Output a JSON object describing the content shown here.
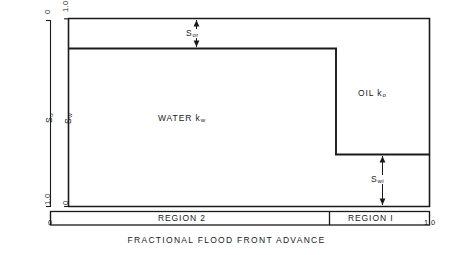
{
  "figure": {
    "caption": "FRACTIONAL  FLOOD  FRONT  ADVANCE",
    "axes": {
      "left_outer": {
        "name": "So",
        "name_base": "S",
        "name_sub": "o",
        "tick_top": "0",
        "tick_bottom": "1.0"
      },
      "left_inner": {
        "name": "Sw",
        "name_base": "S",
        "name_sub": "w",
        "tick_top": "1.0",
        "tick_bottom": "0"
      },
      "bottom": {
        "tick_left": "0",
        "tick_right": "1.0"
      }
    },
    "zones": [
      {
        "id": "water",
        "label_base": "WATER  k",
        "label_sub": "w"
      },
      {
        "id": "oil",
        "label_base": "OIL  k",
        "label_sub": "o"
      }
    ],
    "annotations": [
      {
        "id": "sor",
        "base": "S",
        "sub": "or"
      },
      {
        "id": "swi",
        "base": "S",
        "sub": "wi"
      }
    ],
    "regions": [
      {
        "id": "region-2",
        "label": "REGION  2"
      },
      {
        "id": "region-1",
        "label": "REGION  I"
      }
    ],
    "colors": {
      "line": "#1a1a1a",
      "background": "#ffffff"
    }
  }
}
